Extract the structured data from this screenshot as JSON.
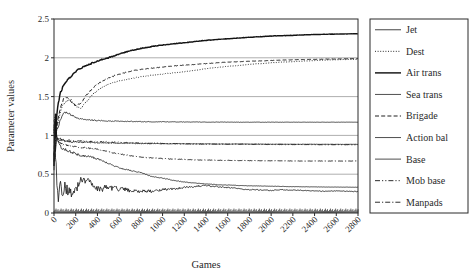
{
  "chart_data": {
    "type": "line",
    "title": "",
    "xlabel": "Games",
    "ylabel": "Parameter values",
    "xlim": [
      0,
      2800
    ],
    "ylim": [
      0,
      2.5
    ],
    "grid": true,
    "grid_axis": "y",
    "legend_position": "right-outside",
    "xticks": [
      0,
      200,
      400,
      600,
      800,
      1000,
      1200,
      1400,
      1600,
      1800,
      2000,
      2200,
      2400,
      2600,
      2800
    ],
    "xtick_labels": [
      "0",
      "200",
      "400",
      "600",
      "800",
      "1000",
      "1200",
      "1400",
      "1600",
      "1800",
      "2000",
      "2200",
      "2400",
      "2600",
      "2800"
    ],
    "yticks": [
      0,
      0.5,
      1,
      1.5,
      2,
      2.5
    ],
    "ytick_labels": [
      "0",
      "0.5",
      "1",
      "1.5",
      "2",
      "2.5"
    ],
    "x": [
      0,
      20,
      40,
      60,
      80,
      100,
      150,
      200,
      250,
      300,
      350,
      400,
      500,
      600,
      700,
      800,
      900,
      1000,
      1100,
      1200,
      1300,
      1400,
      1500,
      1600,
      1700,
      1800,
      1900,
      2000,
      2100,
      2200,
      2300,
      2400,
      2500,
      2600,
      2700,
      2800
    ],
    "series": [
      {
        "name": "Jet",
        "style": "solid-thin",
        "start_value": 1.0,
        "final_value": 0.28,
        "values": [
          1.0,
          0.42,
          0.2,
          0.38,
          0.16,
          0.33,
          0.26,
          0.31,
          0.42,
          0.44,
          0.37,
          0.3,
          0.33,
          0.31,
          0.29,
          0.28,
          0.28,
          0.3,
          0.31,
          0.33,
          0.345,
          0.35,
          0.34,
          0.33,
          0.315,
          0.3,
          0.3,
          0.29,
          0.3,
          0.295,
          0.29,
          0.285,
          0.28,
          0.285,
          0.28,
          0.275
        ]
      },
      {
        "name": "Dest",
        "style": "dotted",
        "start_value": 1.0,
        "final_value": 1.98,
        "values": [
          1.0,
          1.1,
          1.18,
          1.3,
          1.38,
          1.43,
          1.47,
          1.38,
          1.35,
          1.44,
          1.52,
          1.58,
          1.66,
          1.7,
          1.73,
          1.755,
          1.775,
          1.79,
          1.805,
          1.82,
          1.84,
          1.86,
          1.875,
          1.89,
          1.9,
          1.915,
          1.925,
          1.935,
          1.945,
          1.95,
          1.958,
          1.965,
          1.97,
          1.975,
          1.978,
          1.98
        ]
      },
      {
        "name": "Air trans",
        "style": "solid-thick",
        "start_value": 1.0,
        "final_value": 2.31,
        "values": [
          1.0,
          1.25,
          1.42,
          1.55,
          1.62,
          1.68,
          1.75,
          1.82,
          1.87,
          1.9,
          1.93,
          1.96,
          2.0,
          2.05,
          2.09,
          2.12,
          2.145,
          2.165,
          2.18,
          2.195,
          2.21,
          2.225,
          2.235,
          2.245,
          2.255,
          2.265,
          2.272,
          2.28,
          2.285,
          2.29,
          2.295,
          2.3,
          2.303,
          2.306,
          2.308,
          2.31
        ]
      },
      {
        "name": "Sea trans",
        "style": "solid-light",
        "start_value": 1.0,
        "final_value": 1.17,
        "values": [
          1.0,
          1.05,
          1.12,
          1.2,
          1.26,
          1.3,
          1.27,
          1.23,
          1.21,
          1.2,
          1.195,
          1.19,
          1.185,
          1.182,
          1.18,
          1.178,
          1.176,
          1.175,
          1.174,
          1.173,
          1.172,
          1.172,
          1.171,
          1.171,
          1.17,
          1.17,
          1.17,
          1.17,
          1.17,
          1.17,
          1.17,
          1.17,
          1.17,
          1.17,
          1.17,
          1.17
        ]
      },
      {
        "name": "Brigade",
        "style": "dashed",
        "start_value": 1.0,
        "final_value": 1.99,
        "values": [
          1.0,
          1.12,
          1.22,
          1.35,
          1.44,
          1.5,
          1.45,
          1.38,
          1.42,
          1.52,
          1.6,
          1.66,
          1.74,
          1.79,
          1.825,
          1.85,
          1.865,
          1.88,
          1.895,
          1.905,
          1.915,
          1.925,
          1.935,
          1.945,
          1.95,
          1.955,
          1.96,
          1.965,
          1.97,
          1.975,
          1.978,
          1.98,
          1.983,
          1.985,
          1.988,
          1.99
        ]
      },
      {
        "name": "Action bal",
        "style": "solid-light",
        "start_value": 1.0,
        "final_value": 0.885,
        "values": [
          1.0,
          0.97,
          0.95,
          0.94,
          0.93,
          0.925,
          0.92,
          0.915,
          0.912,
          0.91,
          0.908,
          0.906,
          0.903,
          0.9,
          0.898,
          0.896,
          0.895,
          0.894,
          0.893,
          0.892,
          0.891,
          0.89,
          0.89,
          0.889,
          0.889,
          0.888,
          0.888,
          0.887,
          0.887,
          0.886,
          0.886,
          0.886,
          0.885,
          0.885,
          0.885,
          0.885
        ]
      },
      {
        "name": "Base",
        "style": "solid-light",
        "start_value": 1.0,
        "final_value": 0.33,
        "values": [
          1.0,
          0.95,
          0.9,
          0.86,
          0.83,
          0.82,
          0.79,
          0.76,
          0.74,
          0.73,
          0.72,
          0.7,
          0.64,
          0.58,
          0.55,
          0.52,
          0.47,
          0.45,
          0.42,
          0.4,
          0.385,
          0.375,
          0.365,
          0.36,
          0.355,
          0.35,
          0.348,
          0.345,
          0.342,
          0.34,
          0.338,
          0.336,
          0.335,
          0.334,
          0.333,
          0.332
        ]
      },
      {
        "name": "Mob base",
        "style": "dash-dot-dot",
        "start_value": 1.0,
        "final_value": 0.88,
        "values": [
          1.0,
          0.98,
          0.96,
          0.95,
          0.945,
          0.94,
          0.935,
          0.93,
          0.928,
          0.925,
          0.922,
          0.92,
          0.915,
          0.91,
          0.905,
          0.9,
          0.898,
          0.895,
          0.893,
          0.892,
          0.89,
          0.889,
          0.888,
          0.887,
          0.886,
          0.885,
          0.884,
          0.883,
          0.882,
          0.882,
          0.881,
          0.881,
          0.88,
          0.88,
          0.88,
          0.88
        ]
      },
      {
        "name": "Manpads",
        "style": "dash-dot",
        "start_value": 1.0,
        "final_value": 0.67,
        "values": [
          1.0,
          0.95,
          0.92,
          0.9,
          0.885,
          0.875,
          0.86,
          0.85,
          0.845,
          0.84,
          0.83,
          0.82,
          0.79,
          0.76,
          0.74,
          0.72,
          0.71,
          0.7,
          0.695,
          0.69,
          0.685,
          0.682,
          0.68,
          0.678,
          0.676,
          0.675,
          0.674,
          0.673,
          0.672,
          0.671,
          0.67,
          0.67,
          0.67,
          0.67,
          0.67,
          0.67
        ]
      }
    ]
  },
  "legend": {
    "items": [
      {
        "label": "Jet"
      },
      {
        "label": "Dest"
      },
      {
        "label": "Air trans"
      },
      {
        "label": "Sea trans"
      },
      {
        "label": "Brigade"
      },
      {
        "label": "Action bal"
      },
      {
        "label": "Base"
      },
      {
        "label": "Mob base"
      },
      {
        "label": "Manpads"
      }
    ]
  },
  "colors": {
    "line": "#141414",
    "grid": "#8c8c8c",
    "frame": "#2b2b2b",
    "text": "#2a2a2a",
    "background": "#ffffff"
  }
}
